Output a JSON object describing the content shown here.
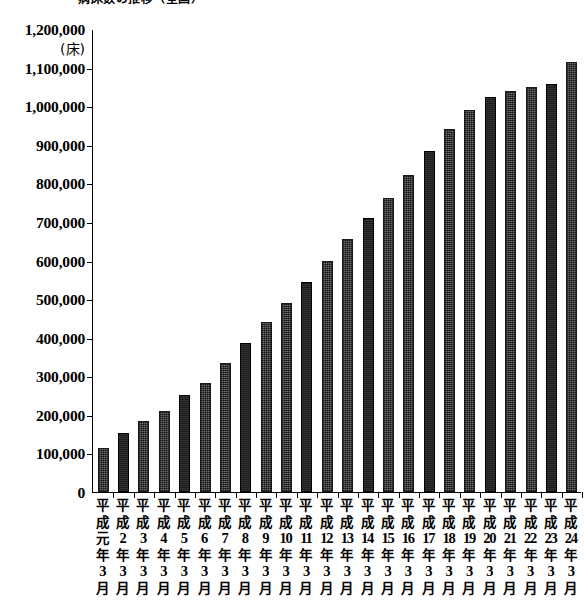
{
  "title": {
    "text": "病床数の推移（全国）",
    "clipped": true
  },
  "axis": {
    "y_unit": "(床)",
    "y_ticks": [
      "1,200,000",
      "1,100,000",
      "1,000,000",
      "900,000",
      "800,000",
      "700,000",
      "600,000",
      "500,000",
      "400,000",
      "300,000",
      "200,000",
      "100,000",
      "0"
    ],
    "y_tick_values": [
      1200000,
      1100000,
      1000000,
      900000,
      800000,
      700000,
      600000,
      500000,
      400000,
      300000,
      200000,
      100000,
      0
    ],
    "era_prefix": "平成",
    "year_suffix": "年",
    "month": "3",
    "month_suffix": "月"
  },
  "colors": {
    "bar_light": "#6e6e6e",
    "bar_dark": "#1c1c1c",
    "axis": "#000000",
    "background": "#ffffff"
  },
  "chart_data": {
    "type": "bar",
    "title": "病床数の推移（全国）",
    "xlabel": "",
    "ylabel": "(床)",
    "ylim": [
      0,
      1200000
    ],
    "ytick_step": 100000,
    "grid": false,
    "legend": "none",
    "categories": [
      "平成元年3月",
      "平成2年3月",
      "平成3年3月",
      "平成4年3月",
      "平成5年3月",
      "平成6年3月",
      "平成7年3月",
      "平成8年3月",
      "平成9年3月",
      "平成10年3月",
      "平成11年3月",
      "平成12年3月",
      "平成13年3月",
      "平成14年3月",
      "平成15年3月",
      "平成16年3月",
      "平成17年3月",
      "平成18年3月",
      "平成19年3月",
      "平成20年3月",
      "平成21年3月",
      "平成22年3月",
      "平成23年3月",
      "平成24年3月"
    ],
    "category_numbers": [
      "元",
      "2",
      "3",
      "4",
      "5",
      "6",
      "7",
      "8",
      "9",
      "10",
      "11",
      "12",
      "13",
      "14",
      "15",
      "16",
      "17",
      "18",
      "19",
      "20",
      "21",
      "22",
      "23",
      "24"
    ],
    "values": [
      115000,
      152000,
      183000,
      210000,
      252000,
      283000,
      335000,
      386000,
      440000,
      490000,
      545000,
      598000,
      655000,
      710000,
      762000,
      822000,
      885000,
      940000,
      990000,
      1025000,
      1040000,
      1050000,
      1058000,
      1115000
    ],
    "bar_shades": [
      "light",
      "dark",
      "light",
      "light",
      "dark",
      "light",
      "light",
      "dark",
      "light",
      "light",
      "dark",
      "light",
      "light",
      "dark",
      "light",
      "light",
      "dark",
      "light",
      "light",
      "dark",
      "light",
      "light",
      "dark",
      "light"
    ]
  }
}
